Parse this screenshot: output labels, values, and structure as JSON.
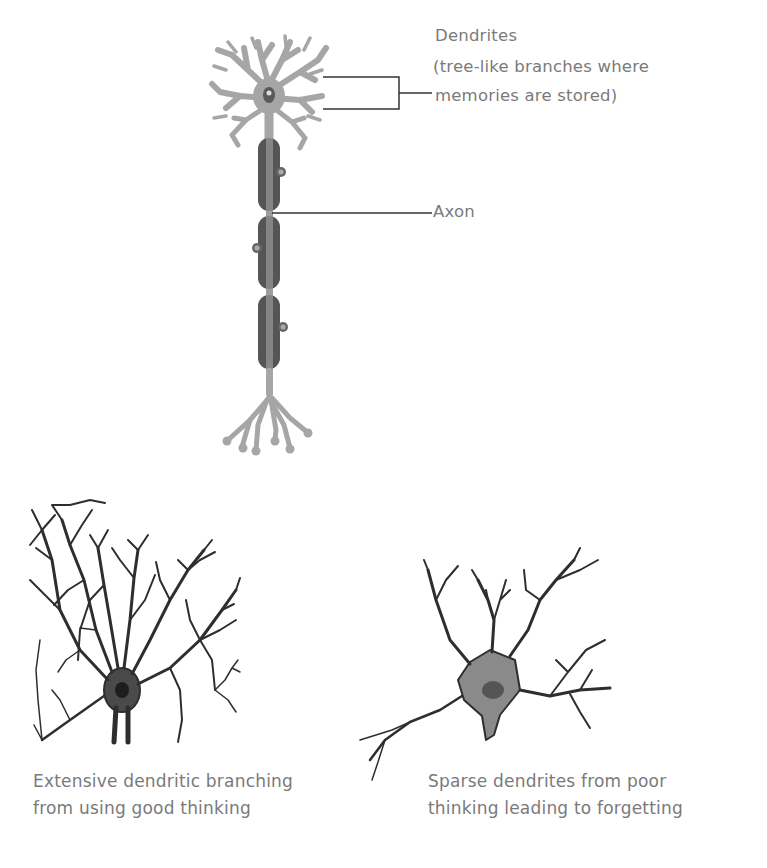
{
  "diagram": {
    "neuron_top": {
      "labels": {
        "dendrites_title": "Dendrites",
        "dendrites_desc_line1": "(tree-like branches where",
        "dendrites_desc_line2": "memories are stored)",
        "axon": "Axon"
      }
    },
    "bottom_left": {
      "caption_line1": "Extensive dendritic branching",
      "caption_line2": "from using good thinking"
    },
    "bottom_right": {
      "caption_line1": "Sparse dendrites from poor",
      "caption_line2": "thinking leading to forgetting"
    },
    "colors": {
      "neuron_light": "#a6a6a6",
      "myelin_dark": "#555555",
      "leader_line": "#333333",
      "text": "#7a7a7a",
      "sketch": "#2e2e2e"
    }
  }
}
